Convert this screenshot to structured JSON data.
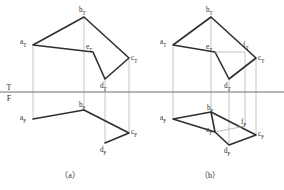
{
  "figure": {
    "reference_line": {
      "top_label": "T",
      "bottom_label": "F",
      "description": "T/F fold line separating top view from front view"
    },
    "colors": {
      "object_line": "#2f2f2f",
      "projection_line": "#b0b0b0",
      "reference_line": "#6e6e6e",
      "text": "#2b2b2b",
      "background": "#ffffff"
    },
    "captions": [
      {
        "text": "（a）",
        "x": 70,
        "y": 178
      },
      {
        "text": "（b）",
        "x": 210,
        "y": 178
      }
    ],
    "diagrams": [
      {
        "id": "a",
        "caption": "（a）",
        "top_view": {
          "label_suffix": "T",
          "polygon_order": [
            "a",
            "b",
            "c",
            "d",
            "e"
          ],
          "points": [
            {
              "id": "a",
              "label": "a",
              "sub": "T",
              "x": 33,
              "y": 45,
              "lx": 20,
              "ly": 44
            },
            {
              "id": "b",
              "label": "b",
              "sub": "T",
              "x": 84,
              "y": 17,
              "lx": 79,
              "ly": 12
            },
            {
              "id": "c",
              "label": "c",
              "sub": "T",
              "x": 129,
              "y": 58,
              "lx": 131,
              "ly": 60
            },
            {
              "id": "d",
              "label": "d",
              "sub": "T",
              "x": 105,
              "y": 79,
              "lx": 100,
              "ly": 88
            },
            {
              "id": "e",
              "label": "e",
              "sub": "T",
              "x": 93,
              "y": 52,
              "lx": 86,
              "ly": 49
            }
          ]
        },
        "front_view": {
          "label_suffix": "F",
          "polyline_order": [
            "a",
            "b",
            "c",
            "d"
          ],
          "points": [
            {
              "id": "a",
              "label": "a",
              "sub": "F",
              "x": 33,
              "y": 119,
              "lx": 20,
              "ly": 120
            },
            {
              "id": "b",
              "label": "b",
              "sub": "F",
              "x": 84,
              "y": 110,
              "lx": 79,
              "ly": 107
            },
            {
              "id": "c",
              "label": "c",
              "sub": "F",
              "x": 129,
              "y": 133,
              "lx": 131,
              "ly": 134
            },
            {
              "id": "d",
              "label": "d",
              "sub": "F",
              "x": 105,
              "y": 143,
              "lx": 100,
              "ly": 152
            }
          ]
        },
        "projection_lines": [
          {
            "x": 33,
            "y1": 45,
            "y2": 119
          },
          {
            "x": 84,
            "y1": 17,
            "y2": 110
          },
          {
            "x": 129,
            "y1": 58,
            "y2": 133
          },
          {
            "x": 105,
            "y1": 79,
            "y2": 143
          }
        ]
      },
      {
        "id": "b",
        "caption": "（b）",
        "top_view": {
          "label_suffix": "T",
          "polygon_order": [
            "a",
            "b",
            "c",
            "d",
            "e"
          ],
          "points": [
            {
              "id": "a",
              "label": "a",
              "sub": "T",
              "x": 173,
              "y": 45,
              "lx": 160,
              "ly": 44
            },
            {
              "id": "b",
              "label": "b",
              "sub": "T",
              "x": 211,
              "y": 17,
              "lx": 206,
              "ly": 12
            },
            {
              "id": "c",
              "label": "c",
              "sub": "T",
              "x": 256,
              "y": 58,
              "lx": 258,
              "ly": 60
            },
            {
              "id": "d",
              "label": "d",
              "sub": "T",
              "x": 229,
              "y": 79,
              "lx": 224,
              "ly": 88
            },
            {
              "id": "e",
              "label": "e",
              "sub": "T",
              "x": 215,
              "y": 52,
              "lx": 206,
              "ly": 49
            },
            {
              "id": "f",
              "label": "f",
              "sub": "T",
              "x": 245,
              "y": 52,
              "lx": 243,
              "ly": 47
            }
          ]
        },
        "front_view": {
          "label_suffix": "F",
          "polygon_order": [
            "a",
            "b",
            "c",
            "d",
            "e"
          ],
          "points": [
            {
              "id": "a",
              "label": "a",
              "sub": "F",
              "x": 173,
              "y": 119,
              "lx": 160,
              "ly": 120
            },
            {
              "id": "b",
              "label": "b",
              "sub": "F",
              "x": 211,
              "y": 112,
              "lx": 207,
              "ly": 110
            },
            {
              "id": "c",
              "label": "c",
              "sub": "F",
              "x": 256,
              "y": 135,
              "lx": 258,
              "ly": 136
            },
            {
              "id": "d",
              "label": "d",
              "sub": "F",
              "x": 229,
              "y": 145,
              "lx": 224,
              "ly": 153
            },
            {
              "id": "e",
              "label": "e",
              "sub": "F",
              "x": 215,
              "y": 132,
              "lx": 206,
              "ly": 132
            },
            {
              "id": "f",
              "label": "f",
              "sub": "F",
              "x": 245,
              "y": 126,
              "lx": 241,
              "ly": 124
            }
          ]
        },
        "projection_lines": [
          {
            "x": 173,
            "y1": 45,
            "y2": 119
          },
          {
            "x": 211,
            "y1": 17,
            "y2": 112
          },
          {
            "x": 256,
            "y1": 58,
            "y2": 135
          },
          {
            "x": 229,
            "y1": 79,
            "y2": 145
          },
          {
            "x": 245,
            "y1": 52,
            "y2": 126
          }
        ]
      }
    ]
  }
}
